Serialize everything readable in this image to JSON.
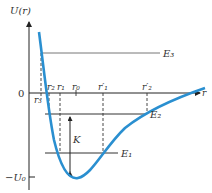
{
  "diagram": {
    "y_axis_label": "U(r)",
    "x_axis_label": "r",
    "zero_label": "0",
    "min_label": "−U₀",
    "energy_levels": [
      {
        "name": "E3",
        "label": "E₃"
      },
      {
        "name": "E2",
        "label": "E₂"
      },
      {
        "name": "E1",
        "label": "E₁"
      }
    ],
    "r_labels": {
      "r3": "r₃",
      "r2": "r₂",
      "r1": "r₁",
      "r0": "r₀",
      "r1p": "r′₁",
      "r2p": "r′₂"
    },
    "kinetic_label": "K",
    "colors": {
      "curve": "#2a8fd0",
      "axes": "#222222",
      "levels": "#555555"
    }
  }
}
